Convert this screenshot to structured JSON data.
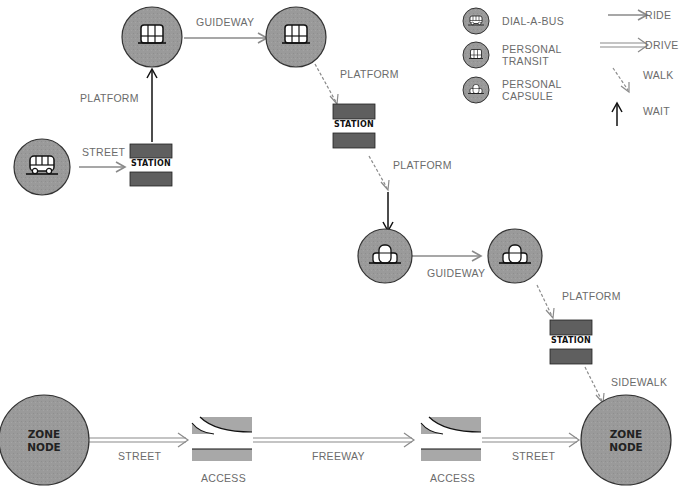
{
  "legend": {
    "vehicles": [
      {
        "icon": "dial-a-bus-icon",
        "label": "DIAL-A-BUS"
      },
      {
        "icon": "personal-transit-icon",
        "label_line1": "PERSONAL",
        "label_line2": "TRANSIT"
      },
      {
        "icon": "personal-capsule-icon",
        "label_line1": "PERSONAL",
        "label_line2": "CAPSULE"
      }
    ],
    "modes": [
      {
        "icon": "ride-arrow-icon",
        "label": "RIDE"
      },
      {
        "icon": "drive-arrow-icon",
        "label": "DRIVE"
      },
      {
        "icon": "walk-arrow-icon",
        "label": "WALK"
      },
      {
        "icon": "wait-arrow-icon",
        "label": "WAIT"
      }
    ]
  },
  "nodes": {
    "station_label": "STATION",
    "zone_line1": "ZONE",
    "zone_line2": "NODE",
    "access_label": "ACCESS"
  },
  "links": {
    "street_1": "STREET",
    "platform_1": "PLATFORM",
    "guideway_1": "GUIDEWAY",
    "platform_2": "PLATFORM",
    "platform_3": "PLATFORM",
    "guideway_2": "GUIDEWAY",
    "platform_4": "PLATFORM",
    "sidewalk": "SIDEWALK",
    "street_2": "STREET",
    "freeway": "FREEWAY",
    "street_3": "STREET"
  },
  "colors": {
    "node_fill": "#9a9a9a",
    "station_fill": "#5f5f5f",
    "access_fill": "#a8a8a8",
    "ride_line": "#8a8a8a",
    "wait_line": "#111111"
  }
}
